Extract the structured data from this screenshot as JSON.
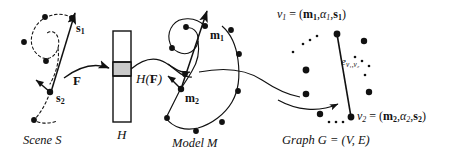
{
  "figure": {
    "type": "diagram",
    "background_color": "#ffffff",
    "ink_color": "#111111",
    "hash_cell_fill": "#c9c9c9"
  },
  "panels": {
    "scene": {
      "caption_word": "Scene",
      "caption_symbol": "S",
      "point_labels": [
        {
          "id": "s1",
          "base": "s",
          "sub": "1"
        },
        {
          "id": "s2",
          "base": "s",
          "sub": "2"
        }
      ]
    },
    "hash": {
      "caption": "H",
      "input_label": {
        "base": "F"
      },
      "output_label": {
        "prefix": "H(",
        "bold": "F",
        "suffix": ")"
      },
      "cell_count": 3,
      "highlighted_cell_index": 1
    },
    "model": {
      "caption_word": "Model",
      "caption_symbol": "M",
      "point_labels": [
        {
          "id": "m1",
          "base": "m",
          "sub": "1"
        },
        {
          "id": "m2",
          "base": "m",
          "sub": "2"
        }
      ]
    },
    "graph": {
      "caption": "Graph G = (V, E)",
      "caption_parts": {
        "word": "Graph",
        "g": "G",
        "equals": "= (",
        "v": "V",
        "comma": ", ",
        "e": "E",
        "close": ")"
      },
      "vertex_top": {
        "name": "v",
        "name_sub": "1",
        "equals": "=",
        "tuple": [
          {
            "base": "m",
            "sub": "1",
            "bold": true
          },
          {
            "base": "α",
            "sub": "1",
            "bold": false
          },
          {
            "base": "s",
            "sub": "1",
            "bold": true
          }
        ]
      },
      "vertex_bottom": {
        "name": "v",
        "name_sub": "2",
        "equals": "=",
        "tuple": [
          {
            "base": "m",
            "sub": "2",
            "bold": true
          },
          {
            "base": "α",
            "sub": "2",
            "bold": false
          },
          {
            "base": "s",
            "sub": "2",
            "bold": true
          }
        ]
      },
      "edge_label": {
        "base": "e",
        "sub": "v1,v2"
      }
    }
  },
  "text": {
    "s1": "s",
    "s1_sub": "1",
    "s2": "s",
    "s2_sub": "2",
    "m1": "m",
    "m1_sub": "1",
    "m2": "m",
    "m2_sub": "2",
    "F": "F",
    "HF_open": "H(",
    "HF_bold": "F",
    "HF_close": ")",
    "H": "H",
    "scene_word": "Scene",
    "scene_sym": "S",
    "model_word": "Model",
    "model_sym": "M",
    "v1": "v",
    "v1_sub": "1",
    "v2": "v",
    "v2_sub": "2",
    "eq": "=",
    "paren_open": "(",
    "paren_close": ")",
    "comma": ",",
    "alpha": "α",
    "graph_word": "Graph",
    "graph_G": "G",
    "graph_tuple": "= (V, E)",
    "edge_e": "e",
    "edge_sub": "v₁,v₂"
  }
}
